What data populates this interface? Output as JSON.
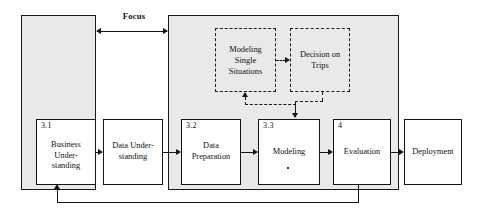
{
  "diagram": {
    "focus_label": "Focus",
    "containers": [
      {
        "id": "left",
        "name": "business-understanding-phase-container"
      },
      {
        "id": "right",
        "name": "data-mining-phase-container"
      }
    ],
    "boxes": [
      {
        "number": "3.1",
        "label": "Business\nUnder-\nstanding"
      },
      {
        "number": "",
        "label": "Data Under-\nstanding"
      },
      {
        "number": "3.2",
        "label": "Data\nPreparation"
      },
      {
        "number": "3.3",
        "label": "Modeling"
      },
      {
        "number": "4",
        "label": "Evaluation"
      },
      {
        "number": "",
        "label": "Deployment"
      }
    ],
    "dashed_boxes": [
      {
        "label": "Modeling\nSingle\nSituations"
      },
      {
        "label": "Decision on\nTrips"
      }
    ],
    "colors": {
      "container_fill": "#e9e9e9",
      "box_fill": "#ffffff",
      "stroke": "#151515",
      "page_background": "#ffffff"
    }
  }
}
